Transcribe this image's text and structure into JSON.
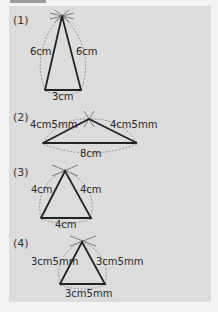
{
  "figure": {
    "background_color": "#dcdcdc",
    "line_color": "#222222",
    "problems": [
      {
        "label": "(1)",
        "sides": {
          "left": "6cm",
          "right": "6cm",
          "base": "3cm"
        },
        "vertices": {
          "apex": [
            62,
            16
          ],
          "left": [
            45,
            90
          ],
          "right": [
            81,
            90
          ]
        }
      },
      {
        "label": "(2)",
        "sides": {
          "left": "4cm5mm",
          "right": "4cm5mm",
          "base": "8cm"
        },
        "vertices": {
          "apex": [
            89,
            119
          ],
          "left": [
            43,
            143
          ],
          "right": [
            137,
            143
          ]
        }
      },
      {
        "label": "(3)",
        "sides": {
          "left": "4cm",
          "right": "4cm",
          "base": "4cm"
        },
        "vertices": {
          "apex": [
            65,
            171
          ],
          "left": [
            41,
            218
          ],
          "right": [
            91,
            218
          ]
        }
      },
      {
        "label": "(4)",
        "sides": {
          "left": "3cm5mm",
          "right": "3cm5mm",
          "base": "3cm5mm"
        },
        "vertices": {
          "apex": [
            82,
            242
          ],
          "left": [
            60,
            284
          ],
          "right": [
            105,
            284
          ]
        }
      }
    ]
  }
}
